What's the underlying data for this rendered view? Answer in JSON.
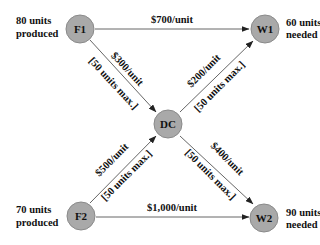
{
  "diagram": {
    "type": "network-flow",
    "nodes": {
      "F1": {
        "label": "F1",
        "note_line1": "80 units",
        "note_line2": "produced"
      },
      "F2": {
        "label": "F2",
        "note_line1": "70 units",
        "note_line2": "produced"
      },
      "DC": {
        "label": "DC"
      },
      "W1": {
        "label": "W1",
        "note_line1": "60 units",
        "note_line2": "needed"
      },
      "W2": {
        "label": "W2",
        "note_line1": "90 units",
        "note_line2": "needed"
      }
    },
    "edges": {
      "F1_W1": {
        "cost": "$700/unit"
      },
      "F2_W2": {
        "cost": "$1,000/unit"
      },
      "F1_DC": {
        "cost": "$300/unit",
        "capacity": "[50 units max.]"
      },
      "F2_DC": {
        "cost": "$500/unit",
        "capacity": "[50 units max.]"
      },
      "DC_W1": {
        "cost": "$200/unit",
        "capacity": "[50 units max.]"
      },
      "DC_W2": {
        "cost": "$400/unit",
        "capacity": "[50 units max.]"
      }
    },
    "colors": {
      "node_fill": "#a9a9a9",
      "edge": "#555555",
      "text": "#111111"
    }
  }
}
